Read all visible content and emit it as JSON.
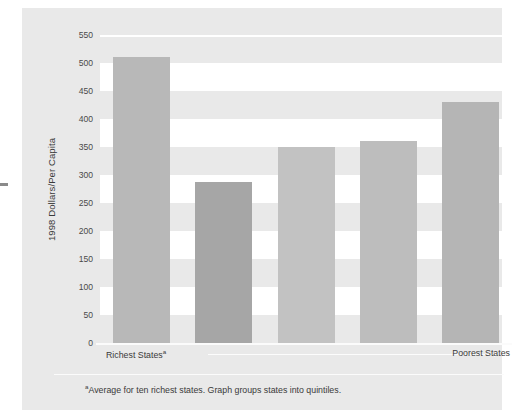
{
  "chart_data": {
    "type": "bar",
    "title": "",
    "subtitle": "",
    "xlabel": "",
    "ylabel": "1998 Dollars/Per Capita",
    "ylim": [
      0,
      550
    ],
    "yticks": [
      0,
      50,
      100,
      150,
      200,
      250,
      300,
      350,
      400,
      450,
      500,
      550
    ],
    "ytick_labels": [
      "0",
      "50",
      "100",
      "150",
      "200",
      "250",
      "300",
      "350",
      "400",
      "450",
      "500",
      "550"
    ],
    "grid": "horizontal-banded",
    "legend": "none",
    "categories": [
      "Quintile 1",
      "Quintile 2",
      "Quintile 3",
      "Quintile 4",
      "Quintile 5"
    ],
    "values": [
      510,
      288,
      350,
      360,
      430
    ],
    "bar_colors": [
      "#b8b8b8",
      "#a6a6a6",
      "#c2c2c2",
      "#bdbdbd",
      "#b5b5b5"
    ],
    "axis_left_caption": "Richest States",
    "axis_left_caption_sup": "a",
    "axis_right_caption": "Poorest States",
    "annotations": [
      "arrow from Richest States to Poorest States"
    ],
    "footnote_sup": "a",
    "footnote": "Average for ten richest states. Graph groups states into quintiles."
  },
  "colors": {
    "panel_background": "#e9e9e9",
    "band_white": "#ffffff",
    "text": "#3a3a3a",
    "tick_text": "#4a4a4a"
  },
  "bands": [
    {
      "from": 450,
      "to": 500
    },
    {
      "from": 350,
      "to": 400
    },
    {
      "from": 250,
      "to": 300
    },
    {
      "from": 150,
      "to": 200
    },
    {
      "from": 50,
      "to": 100
    }
  ]
}
